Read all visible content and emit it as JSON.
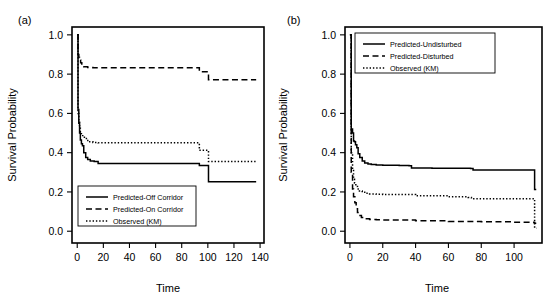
{
  "figure": {
    "background": "#ffffff",
    "ink_color": "#000000",
    "panel_count": 2
  },
  "chart_data": [
    {
      "type": "line",
      "panel_tag": "(a)",
      "title": "",
      "xlabel": "Time",
      "ylabel": "Survival Probability",
      "xlim": [
        -4,
        143
      ],
      "ylim": [
        -0.06,
        1.04
      ],
      "xticks": [
        0,
        20,
        40,
        60,
        80,
        100,
        120,
        140
      ],
      "xtick_labels": [
        "0",
        "20",
        "40",
        "60",
        "80",
        "100",
        "120",
        "140"
      ],
      "yticks": [
        0.0,
        0.2,
        0.4,
        0.6,
        0.8,
        1.0
      ],
      "ytick_labels": [
        "0.0",
        "0.2",
        "0.4",
        "0.6",
        "0.8",
        "1.0"
      ],
      "grid": false,
      "legend_position": "bottom-left",
      "step_style": "post",
      "series": [
        {
          "name": "Predicted-Off Corridor",
          "style": "solid",
          "x": [
            0,
            0.6,
            1.2,
            1.8,
            2.4,
            3.2,
            4.0,
            5.0,
            6.5,
            8.0,
            10.0,
            13.0,
            16.0,
            20.0,
            40.0,
            60.0,
            80.0,
            92.0,
            93.5,
            99.0,
            100.5,
            120.0,
            137.0
          ],
          "y": [
            1.0,
            0.62,
            0.55,
            0.5,
            0.465,
            0.445,
            0.435,
            0.4,
            0.375,
            0.365,
            0.358,
            0.355,
            0.345,
            0.345,
            0.345,
            0.345,
            0.345,
            0.345,
            0.335,
            0.335,
            0.252,
            0.252,
            0.252
          ]
        },
        {
          "name": "Predicted-On Corridor",
          "style": "dashed",
          "x": [
            0,
            0.6,
            1.2,
            1.8,
            2.6,
            3.5,
            5.0,
            8.0,
            12.0,
            20.0,
            40.0,
            60.0,
            80.0,
            92.0,
            93.5,
            99.0,
            100.5,
            120.0,
            137.0
          ],
          "y": [
            1.0,
            0.9,
            0.885,
            0.872,
            0.858,
            0.845,
            0.838,
            0.834,
            0.832,
            0.832,
            0.832,
            0.832,
            0.832,
            0.832,
            0.812,
            0.812,
            0.772,
            0.772,
            0.772
          ]
        },
        {
          "name": "Observed (KM)",
          "style": "dotted",
          "x": [
            0,
            0.6,
            1.2,
            1.8,
            2.4,
            3.2,
            4.2,
            5.5,
            7.0,
            9.0,
            12.0,
            16.0,
            20.0,
            40.0,
            60.0,
            80.0,
            92.0,
            93.5,
            99.0,
            100.5,
            120.0,
            137.0
          ],
          "y": [
            1.0,
            0.6,
            0.555,
            0.525,
            0.505,
            0.492,
            0.482,
            0.472,
            0.462,
            0.455,
            0.452,
            0.45,
            0.45,
            0.45,
            0.45,
            0.45,
            0.45,
            0.412,
            0.412,
            0.355,
            0.355,
            0.355
          ]
        }
      ]
    },
    {
      "type": "line",
      "panel_tag": "(b)",
      "title": "",
      "xlabel": "Time",
      "ylabel": "Survival Probability",
      "xlim": [
        -3,
        117
      ],
      "ylim": [
        -0.06,
        1.04
      ],
      "xticks": [
        0,
        20,
        40,
        60,
        80,
        100
      ],
      "xtick_labels": [
        "0",
        "20",
        "40",
        "60",
        "80",
        "100"
      ],
      "yticks": [
        0.0,
        0.2,
        0.4,
        0.6,
        0.8,
        1.0
      ],
      "ytick_labels": [
        "0.0",
        "0.2",
        "0.4",
        "0.6",
        "0.8",
        "1.0"
      ],
      "grid": false,
      "legend_position": "top-left",
      "step_style": "post",
      "series": [
        {
          "name": "Predicted-Undisturbed",
          "style": "solid",
          "x": [
            0,
            0.8,
            1.6,
            2.2,
            2.8,
            3.4,
            4.2,
            5.0,
            6.0,
            7.5,
            9.0,
            11.0,
            13.0,
            16.0,
            20.0,
            30.0,
            36.0,
            37.5,
            50.0,
            70.0,
            73.5,
            75.0,
            100.0,
            112.0,
            112.5,
            113.5
          ],
          "y": [
            1.0,
            0.52,
            0.5,
            0.46,
            0.455,
            0.44,
            0.425,
            0.395,
            0.375,
            0.358,
            0.348,
            0.342,
            0.34,
            0.337,
            0.336,
            0.335,
            0.334,
            0.322,
            0.321,
            0.321,
            0.32,
            0.312,
            0.312,
            0.312,
            0.212,
            0.212
          ]
        },
        {
          "name": "Predicted-Disturbed",
          "style": "dashed",
          "x": [
            0,
            0.8,
            1.6,
            2.2,
            3.0,
            3.8,
            4.6,
            5.6,
            7.0,
            9.0,
            12.0,
            16.0,
            20.0,
            40.0,
            60.0,
            80.0,
            100.0,
            112.0,
            112.5,
            113.5
          ],
          "y": [
            1.0,
            0.3,
            0.215,
            0.175,
            0.145,
            0.115,
            0.095,
            0.08,
            0.07,
            0.064,
            0.06,
            0.058,
            0.057,
            0.053,
            0.05,
            0.048,
            0.046,
            0.045,
            0.04,
            0.04
          ]
        },
        {
          "name": "Observed (KM)",
          "style": "dotted",
          "x": [
            0,
            0.8,
            1.6,
            2.2,
            2.8,
            3.6,
            4.6,
            5.8,
            7.5,
            9.5,
            12.0,
            16.0,
            20.0,
            40.0,
            60.0,
            72.0,
            74.0,
            90.0,
            100.0,
            112.0,
            112.5,
            113.5
          ],
          "y": [
            1.0,
            0.4,
            0.315,
            0.265,
            0.245,
            0.228,
            0.215,
            0.205,
            0.198,
            0.193,
            0.19,
            0.188,
            0.187,
            0.18,
            0.175,
            0.172,
            0.165,
            0.165,
            0.165,
            0.165,
            0.015,
            0.015
          ]
        }
      ]
    }
  ]
}
